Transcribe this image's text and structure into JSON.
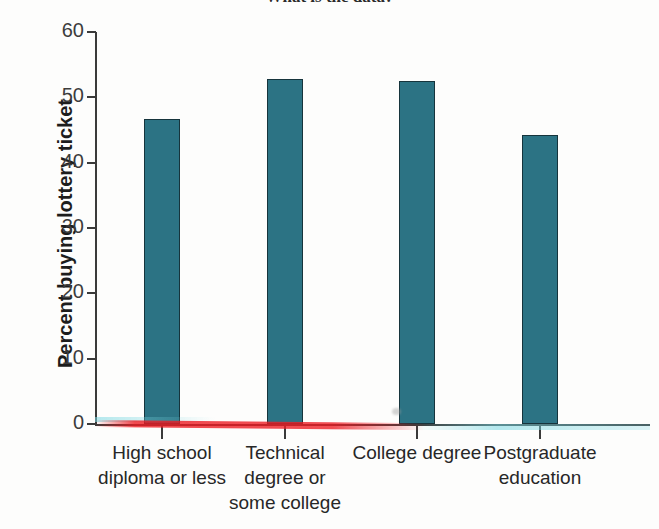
{
  "figure": {
    "clipped_title": "What is the data?",
    "background_color": "#fdfdfc"
  },
  "chart_data": {
    "type": "bar",
    "title": "",
    "xlabel": "",
    "ylabel": "Percent buying lottery ticket",
    "categories": [
      "High school diploma or less",
      "Technical degree or some college",
      "College degree",
      "Postgraduate education"
    ],
    "category_lines": [
      [
        "High school",
        "diploma or less"
      ],
      [
        "Technical",
        "degree or",
        "some college"
      ],
      [
        "College degree"
      ],
      [
        "Postgraduate",
        "education"
      ]
    ],
    "values": [
      46.7,
      52.8,
      52.5,
      44.2
    ],
    "ylim": [
      0,
      60
    ],
    "yticks": [
      0,
      10,
      20,
      30,
      40,
      50,
      60
    ],
    "ytick_labels": [
      "0",
      "10",
      "20",
      "30",
      "40",
      "50",
      "60"
    ],
    "grid": false,
    "legend": null,
    "bar_color": "#2c7384",
    "bar_edge_color": "#16343c",
    "axis_color": "#3a3a3a"
  },
  "artifacts": {
    "red_streak": "scan-streak-red",
    "cyan_streak_left": "scan-streak-cyan-left",
    "cyan_streak_right": "scan-streak-cyan-right",
    "smudge": "scan-smudge"
  }
}
